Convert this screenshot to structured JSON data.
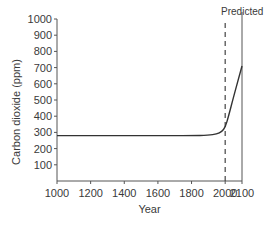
{
  "chart_data": {
    "type": "line",
    "title": "",
    "xlabel": "Year",
    "ylabel": "Carbon dioxide (ppm)",
    "xlim": [
      1000,
      2100
    ],
    "ylim": [
      0,
      1000
    ],
    "x_ticks": [
      1000,
      1200,
      1400,
      1600,
      1800,
      2000,
      2100
    ],
    "y_ticks": [
      100,
      200,
      300,
      400,
      500,
      600,
      700,
      800,
      900,
      1000
    ],
    "grid": false,
    "legend": null,
    "annotations": [
      {
        "type": "vertical-dashed-line",
        "x": 2000,
        "label": "Predicted"
      }
    ],
    "series": [
      {
        "name": "Carbon dioxide",
        "x": [
          1000,
          1200,
          1400,
          1600,
          1800,
          1900,
          1950,
          1980,
          2000,
          2020,
          2050,
          2100
        ],
        "values": [
          280,
          280,
          280,
          280,
          280,
          282,
          290,
          305,
          330,
          400,
          520,
          710
        ]
      }
    ]
  },
  "labels": {
    "predicted": "Predicted",
    "xlabel": "Year",
    "ylabel": "Carbon dioxide (ppm)"
  }
}
